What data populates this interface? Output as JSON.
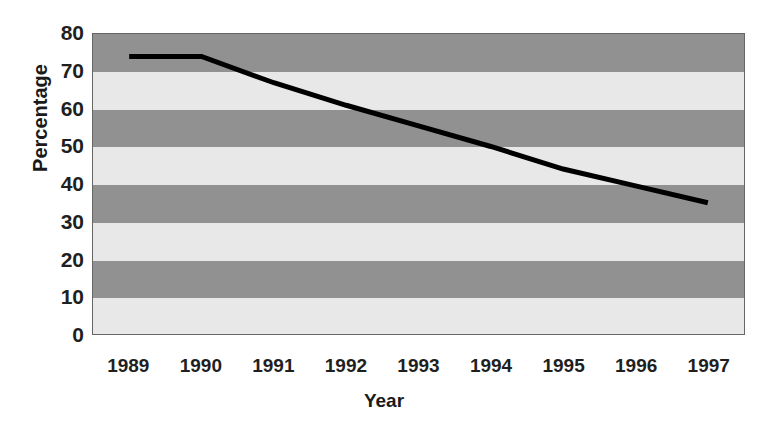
{
  "chart_data": {
    "type": "line",
    "title": "",
    "xlabel": "Year",
    "ylabel": "Percentage",
    "categories": [
      "1989",
      "1990",
      "1991",
      "1992",
      "1993",
      "1994",
      "1995",
      "1996",
      "1997"
    ],
    "values": [
      74,
      74,
      67,
      61,
      55.5,
      50,
      44,
      39.5,
      35
    ],
    "series": [
      {
        "name": "Percentage",
        "values": [
          74,
          74,
          67,
          61,
          55.5,
          50,
          44,
          39.5,
          35
        ]
      }
    ],
    "ylim": [
      0,
      80
    ],
    "yticks": [
      0,
      10,
      20,
      30,
      40,
      50,
      60,
      70,
      80
    ],
    "ytick_labels": [
      "0",
      "10",
      "20",
      "30",
      "40",
      "50",
      "60",
      "70",
      "80"
    ],
    "grid": false,
    "legend": "none",
    "band_style": "alternating-horizontal",
    "colors": {
      "line": "#000000",
      "band_dark": "#919191",
      "band_light": "#e8e8e8",
      "axis": "#666666",
      "text": "#1f1f1f",
      "background": "#ffffff"
    },
    "line_width": 5
  }
}
